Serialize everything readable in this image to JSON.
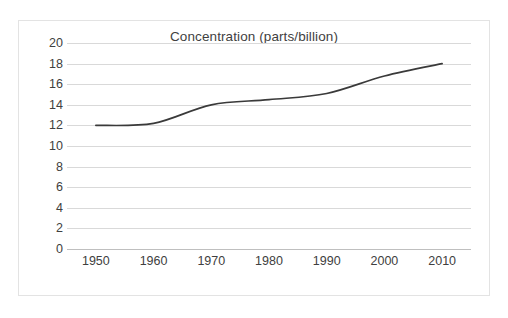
{
  "chart_data": {
    "type": "line",
    "title": "Concentration (parts/billion)",
    "xlabel": "",
    "ylabel": "",
    "x": [
      1950,
      1960,
      1970,
      1980,
      1990,
      2000,
      2010
    ],
    "categories": [
      "1950",
      "1960",
      "1970",
      "1980",
      "1990",
      "2000",
      "2010"
    ],
    "series": [
      {
        "name": "Concentration",
        "values": [
          12,
          12.2,
          14,
          14.5,
          15.1,
          16.8,
          18
        ],
        "color": "#3a3a3a"
      }
    ],
    "xlim": [
      1945,
      2015
    ],
    "ylim": [
      0,
      20
    ],
    "ytick_labels": [
      "20",
      "18",
      "16",
      "14",
      "12",
      "10",
      "8",
      "6",
      "4",
      "2",
      "0"
    ],
    "ytick_values": [
      20,
      18,
      16,
      14,
      12,
      10,
      8,
      6,
      4,
      2,
      0
    ],
    "xtick_labels": [
      "1950",
      "1960",
      "1970",
      "1980",
      "1990",
      "2000",
      "2010"
    ],
    "xtick_values": [
      1950,
      1960,
      1970,
      1980,
      1990,
      2000,
      2010
    ],
    "grid": "horizontal",
    "legend": "none",
    "smoothing": true,
    "gridline_color": "#d9d9d9",
    "axis_color": "#bfbfbf",
    "text_color": "#404040",
    "border_color": "#e3e3e3",
    "background": "#ffffff"
  }
}
